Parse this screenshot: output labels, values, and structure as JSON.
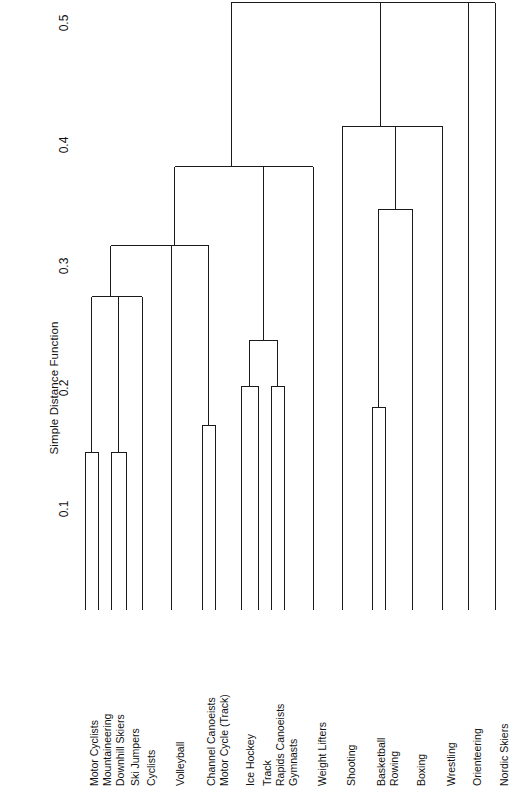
{
  "figure": {
    "kind": "dendrogram",
    "background": "#ffffff",
    "line_color": "#1a1a1a",
    "axis_title": "Simple Distance Function"
  },
  "chart_data": {
    "type": "line",
    "subtype": "dendrogram",
    "title": "",
    "xlabel": "",
    "ylabel": "Simple Distance Function",
    "ylim": [
      0.0,
      0.52
    ],
    "yticks": [
      0.1,
      0.2,
      0.3,
      0.4,
      0.5
    ],
    "ytick_labels": [
      "0.1",
      "0.2",
      "0.3",
      "0.4",
      "0.5"
    ],
    "grid": false,
    "legend": "none",
    "orientation": "vertical",
    "leaf_count": 20,
    "categories": [
      "Motor Cyclists",
      "Mountaineering",
      "Downhill Skiers",
      "Ski Jumpers",
      "Cyclists",
      "Volleyball",
      "Channel Canoeists",
      "Motor Cycle (Track)",
      "Ice Hockey",
      "Track",
      "Rapids Canoeists",
      "Gymnasts",
      "Weight Lifters",
      "Shooting",
      "Basketball",
      "Rowing",
      "Boxing",
      "Wrestling",
      "Orienteering",
      "Nordic Skiers"
    ],
    "leaf_x": [
      85,
      98,
      111,
      126,
      142,
      171,
      202,
      215,
      241,
      258,
      271,
      284,
      313,
      342,
      372,
      385,
      412,
      442,
      468,
      495
    ],
    "merges": [
      {
        "id": "m1",
        "left": "Motor Cyclists",
        "right": "Mountaineering",
        "height": 0.13
      },
      {
        "id": "m2",
        "left": "Downhill Skiers",
        "right": "Ski Jumpers",
        "height": 0.13
      },
      {
        "id": "m3",
        "left": "m2",
        "right": "Cyclists",
        "height": 0.258
      },
      {
        "id": "m4",
        "left": "m1",
        "right": "m3",
        "height": 0.258
      },
      {
        "id": "m5",
        "left": "Channel Canoeists",
        "right": "Motor Cycle (Track)",
        "height": 0.152
      },
      {
        "id": "m6",
        "left": "m4",
        "right": "Volleyball",
        "height": 0.3
      },
      {
        "id": "m7",
        "left": "m6",
        "right": "m5",
        "height": 0.3
      },
      {
        "id": "m8",
        "left": "Ice Hockey",
        "right": "Track",
        "height": 0.184
      },
      {
        "id": "m9",
        "left": "Rapids Canoeists",
        "right": "Gymnasts",
        "height": 0.184
      },
      {
        "id": "m10",
        "left": "m8",
        "right": "m9",
        "height": 0.222
      },
      {
        "id": "m11",
        "left": "m10",
        "right": "Weight Lifters",
        "height": 0.365
      },
      {
        "id": "m12",
        "left": "m7",
        "right": "m11",
        "height": 0.365
      },
      {
        "id": "m13",
        "left": "Basketball",
        "right": "Rowing",
        "height": 0.167
      },
      {
        "id": "m14",
        "left": "m13",
        "right": "Boxing",
        "height": 0.33
      },
      {
        "id": "m15",
        "left": "m14",
        "right": "Wrestling",
        "height": 0.398
      },
      {
        "id": "m16",
        "left": "Shooting",
        "right": "m15",
        "height": 0.398
      },
      {
        "id": "m17",
        "left": "m12",
        "right": "m16",
        "height": 0.5
      },
      {
        "id": "m18",
        "left": "m17",
        "right": "Orienteering",
        "height": 0.5
      },
      {
        "id": "m19",
        "left": "m18",
        "right": "Nordic Skiers",
        "height": 0.5
      }
    ]
  }
}
